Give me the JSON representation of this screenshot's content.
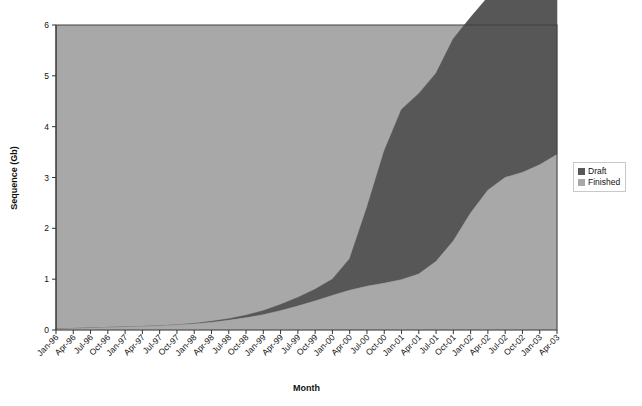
{
  "chart_data": {
    "type": "area",
    "stacked": true,
    "title": "",
    "xlabel": "Month",
    "ylabel": "Sequence (Gb)",
    "ylim": [
      0,
      6
    ],
    "yticks": [
      0,
      1,
      2,
      3,
      4,
      5,
      6
    ],
    "grid": false,
    "legend_position": "right",
    "categories": [
      "Jan-96",
      "Apr-96",
      "Jul-96",
      "Oct-96",
      "Jan-97",
      "Apr-97",
      "Jul-97",
      "Oct-97",
      "Jan-98",
      "Apr-98",
      "Jul-98",
      "Oct-98",
      "Jan-99",
      "Apr-99",
      "Jul-99",
      "Oct-99",
      "Jan-00",
      "Apr-00",
      "Jul-00",
      "Oct-00",
      "Jan-01",
      "Apr-01",
      "Jul-01",
      "Oct-01",
      "Jan-02",
      "Apr-02",
      "Jul-02",
      "Oct-02",
      "Jan-03",
      "Apr-03"
    ],
    "series": [
      {
        "name": "Finished",
        "color": "#a8a8a8",
        "values": [
          0.02,
          0.03,
          0.04,
          0.05,
          0.06,
          0.07,
          0.08,
          0.1,
          0.12,
          0.15,
          0.19,
          0.24,
          0.3,
          0.38,
          0.47,
          0.57,
          0.68,
          0.78,
          0.86,
          0.92,
          0.99,
          1.1,
          1.35,
          1.75,
          2.3,
          2.75,
          3.0,
          3.1,
          3.25,
          3.45
        ]
      },
      {
        "name": "Draft",
        "color": "#575757",
        "values": [
          0.0,
          0.0,
          0.0,
          0.0,
          0.0,
          0.0,
          0.0,
          0.0,
          0.01,
          0.02,
          0.03,
          0.05,
          0.08,
          0.12,
          0.17,
          0.23,
          0.32,
          0.62,
          1.55,
          2.6,
          3.35,
          3.55,
          3.7,
          3.98,
          3.85,
          3.8,
          3.88,
          3.95,
          3.95,
          3.97
        ]
      }
    ],
    "totals": [
      0.02,
      0.03,
      0.04,
      0.05,
      0.06,
      0.07,
      0.08,
      0.1,
      0.13,
      0.17,
      0.22,
      0.29,
      0.38,
      0.5,
      0.64,
      0.8,
      1.0,
      1.4,
      2.41,
      3.52,
      4.34,
      4.65,
      5.05,
      5.73,
      6.15,
      6.55,
      6.88,
      7.05,
      7.2,
      7.42
    ]
  },
  "legend": {
    "items": [
      {
        "label": "Draft",
        "color": "#575757"
      },
      {
        "label": "Finished",
        "color": "#a8a8a8"
      }
    ]
  },
  "plot": {
    "background": "#a8a8a8",
    "border_color": "#404040"
  }
}
